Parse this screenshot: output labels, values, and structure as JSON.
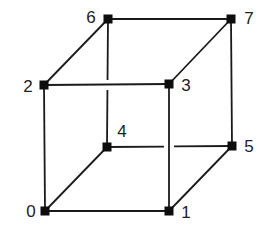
{
  "diagram": {
    "type": "cube-graph",
    "colors": {
      "edge": "#1a1a1a",
      "node": "#0d0d0d",
      "label": "#222222",
      "background": "#ffffff"
    },
    "nodes": [
      {
        "id": "0",
        "label": "0",
        "x": 45,
        "y": 211,
        "label_x": 31,
        "label_y": 211,
        "label_anchor": "middle"
      },
      {
        "id": "1",
        "label": "1",
        "x": 169,
        "y": 211,
        "label_x": 186,
        "label_y": 212,
        "label_anchor": "middle"
      },
      {
        "id": "2",
        "label": "2",
        "x": 44,
        "y": 85,
        "label_x": 28,
        "label_y": 86,
        "label_anchor": "middle"
      },
      {
        "id": "3",
        "label": "3",
        "x": 169,
        "y": 84,
        "label_x": 186,
        "label_y": 85,
        "label_anchor": "middle"
      },
      {
        "id": "4",
        "label": "4",
        "x": 107,
        "y": 147,
        "label_x": 122,
        "label_y": 131,
        "label_anchor": "middle"
      },
      {
        "id": "5",
        "label": "5",
        "x": 232,
        "y": 146,
        "label_x": 249,
        "label_y": 146,
        "label_anchor": "middle"
      },
      {
        "id": "6",
        "label": "6",
        "x": 108,
        "y": 19,
        "label_x": 91,
        "label_y": 17,
        "label_anchor": "middle"
      },
      {
        "id": "7",
        "label": "7",
        "x": 231,
        "y": 19,
        "label_x": 249,
        "label_y": 18,
        "label_anchor": "middle"
      }
    ],
    "edges": [
      {
        "from": "0",
        "to": "1"
      },
      {
        "from": "0",
        "to": "2"
      },
      {
        "from": "0",
        "to": "4"
      },
      {
        "from": "1",
        "to": "3"
      },
      {
        "from": "1",
        "to": "5"
      },
      {
        "from": "2",
        "to": "3"
      },
      {
        "from": "2",
        "to": "6"
      },
      {
        "from": "3",
        "to": "7"
      },
      {
        "from": "4",
        "to": "5",
        "gap": {
          "start": 164,
          "end": 174,
          "axis": "x"
        }
      },
      {
        "from": "4",
        "to": "6",
        "gap": {
          "start": 80,
          "end": 90,
          "axis": "y"
        }
      },
      {
        "from": "5",
        "to": "7"
      },
      {
        "from": "6",
        "to": "7"
      }
    ],
    "node_size": 9
  }
}
